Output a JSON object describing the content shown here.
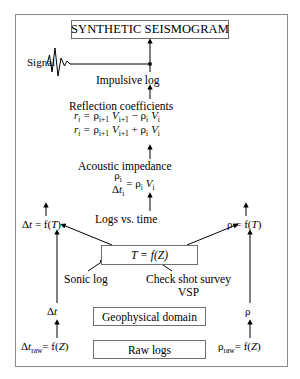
{
  "diagram": {
    "title_box": "SYNTHETIC SEISMOGRAM",
    "nodes": {
      "seismogram": "SYNTHETIC SEISMOGRAM",
      "time_depth": "T = f(Z)",
      "geophysical_domain": "Geophysical domain",
      "raw_logs": "Raw logs"
    },
    "labels": {
      "signal": "Signal",
      "impulsive_log": "Impulsive log",
      "reflection_coefficients": "Reflection coefficients",
      "acoustic_impedance": "Acoustic impedance",
      "logs_vs_time": "Logs vs. time",
      "sonic_log": "Sonic log",
      "check_shot_survey": "Check shot survey",
      "vsp": "VSP"
    },
    "side_values": {
      "delta_t_of_T": "Δt = f(T)",
      "rho_of_T": "ρ = f(T)",
      "delta_t": "Δt",
      "rho": "ρ",
      "delta_t_raw_of_Z": "Δt_raw = f(Z)",
      "rho_raw_of_Z": "ρ_raw = f(Z)"
    },
    "formulas": {
      "reflection_coefficient": {
        "lhs": "r_i =",
        "numerator": "ρ_{i+1} V_{i+1} − ρ_i V_i",
        "denominator": "ρ_{i+1} V_{i+1} + ρ_i V_i"
      },
      "acoustic_impedance": {
        "numerator": "ρ_i",
        "denominator": "Δt_i",
        "equals": "= ρ_i V_i"
      }
    },
    "colors": {
      "ink": "#000000",
      "frame": "#8a8a8a",
      "box_border": "#6f6f6f",
      "background": "#ffffff"
    },
    "icons": {
      "waveform": "seismic-wavelet",
      "arrow": "arrow-up"
    }
  }
}
